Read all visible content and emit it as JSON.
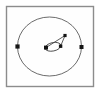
{
  "figure": {
    "width": 101,
    "height": 94,
    "background_color": "#ffffff"
  },
  "frame": {
    "name": "plot-frame",
    "x": 6.5,
    "y": 6.5,
    "width": 87,
    "height": 80,
    "stroke_color": "#8c8c8c",
    "fill_color": "#fefefe"
  },
  "chart_data": {
    "type": "scatter",
    "title": "",
    "subtitle": "",
    "xlabel": "",
    "ylabel": "",
    "grid": false,
    "legend": false,
    "axis_ticks": false,
    "xlim": [
      6.5,
      93.5
    ],
    "ylim": [
      6.5,
      86.5
    ],
    "orbits": [
      {
        "name": "outer-orbit",
        "shape": "ellipse",
        "center_x": 49.5,
        "center_y": 46.5,
        "radius_x": 32.0,
        "radius_y": 29.5,
        "rotation_deg": 0,
        "stroke_color": "#5a5a5a",
        "stroke_width": 0.9
      },
      {
        "name": "inner-orbit",
        "shape": "ellipse",
        "center_x": 53.0,
        "center_y": 46.8,
        "radius_x": 8.0,
        "radius_y": 4.2,
        "rotation_deg": -12,
        "stroke_color": "#4a4a4a",
        "stroke_width": 0.9
      }
    ],
    "links": [
      {
        "name": "radius-vector",
        "from_x": 46.0,
        "from_y": 47.6,
        "to_x": 65.0,
        "to_y": 35.5,
        "stroke_color": "#4a4a4a",
        "stroke_width": 0.9
      },
      {
        "name": "chord-vector",
        "from_x": 60.6,
        "from_y": 46.2,
        "to_x": 65.0,
        "to_y": 35.5,
        "stroke_color": "#4a4a4a",
        "stroke_width": 0.9
      }
    ],
    "points": [
      {
        "name": "outer-node-left",
        "x": 17.5,
        "y": 46.5,
        "marker": "square",
        "size": 4.2,
        "color": "#141414"
      },
      {
        "name": "outer-node-right",
        "x": 81.5,
        "y": 47.0,
        "marker": "square",
        "size": 4.0,
        "color": "#141414"
      },
      {
        "name": "inner-node-left",
        "x": 46.0,
        "y": 47.6,
        "marker": "square",
        "size": 4.0,
        "color": "#141414"
      },
      {
        "name": "inner-node-right",
        "x": 60.6,
        "y": 46.2,
        "marker": "square",
        "size": 3.4,
        "color": "#141414"
      },
      {
        "name": "apex-node",
        "x": 65.0,
        "y": 35.5,
        "marker": "square",
        "size": 3.2,
        "color": "#141414"
      }
    ],
    "annotations": []
  }
}
